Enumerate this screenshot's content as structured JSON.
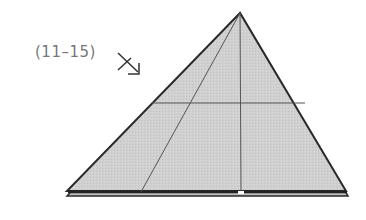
{
  "diagram": {
    "step_label": "(11–15)",
    "arrow_icon": "fold-arrow-down-right-icon",
    "colors": {
      "paper_fill": "#cfcfcf",
      "outline": "#2a2a2a",
      "crease": "#555555",
      "label": "#777777"
    },
    "shape": "triangle-fold",
    "creases": [
      "vertical-center",
      "horizontal-mid",
      "diagonal-left"
    ]
  }
}
